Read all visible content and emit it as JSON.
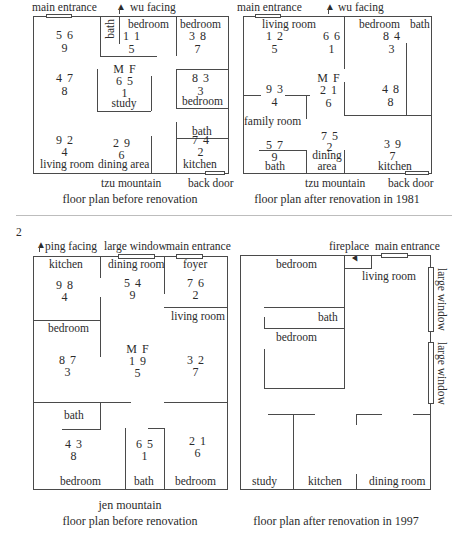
{
  "figure_number": "2",
  "plan1": {
    "top_labels": {
      "entrance": "main entrance",
      "facing": "wu facing"
    },
    "rooms": {
      "bath": "bath",
      "bedroom_a": "bedroom",
      "bedroom_b": "bedroom",
      "study": "study",
      "bedroom_c": "bedroom",
      "bath2": "bath",
      "living_room": "living room",
      "dining_area": "dining area",
      "kitchen": "kitchen"
    },
    "numbers": {
      "nw": [
        "5 6",
        "9"
      ],
      "bedroom_a": [
        "1 1",
        "5"
      ],
      "bedroom_b": [
        "3 8",
        "7"
      ],
      "w": [
        "4 7",
        "8"
      ],
      "center_head": "M F",
      "center": [
        "6 5",
        "1"
      ],
      "bedroom_c": [
        "8 3",
        "3"
      ],
      "sw": [
        "9 2",
        "4"
      ],
      "s": [
        "2 9",
        "6"
      ],
      "se": [
        "7 4",
        "2"
      ]
    },
    "bottom_labels": {
      "mountain": "tzu mountain",
      "back_door": "back door"
    },
    "caption": "floor plan before renovation"
  },
  "plan2": {
    "top_labels": {
      "entrance": "main entrance",
      "facing": "wu facing"
    },
    "rooms": {
      "living_room": "living room",
      "bedroom": "bedroom",
      "bath": "bath",
      "family_room": "family room",
      "bath2": "bath",
      "dining_area_1": "dining",
      "dining_area_2": "area",
      "kitchen": "kitchen"
    },
    "numbers": {
      "nw": [
        "1 2",
        "5"
      ],
      "n": [
        "6 6",
        "1"
      ],
      "ne": [
        "8 4",
        "3"
      ],
      "w": [
        "9 3",
        "4"
      ],
      "center_head": "M F",
      "center": [
        "2 1",
        "6"
      ],
      "e": [
        "4 8",
        "8"
      ],
      "sw": [
        "5 7",
        "9"
      ],
      "s": [
        "7 5",
        "2"
      ],
      "se": [
        "3 9",
        "7"
      ]
    },
    "bottom_labels": {
      "mountain": "tzu mountain",
      "back_door": "back door"
    },
    "caption": "floor plan after renovation in 1981"
  },
  "plan3": {
    "top_labels": {
      "facing": "ping facing",
      "window": "large window",
      "entrance": "main entrance"
    },
    "rooms": {
      "kitchen": "kitchen",
      "dining_room": "dining room",
      "foyer": "foyer",
      "living_room": "living room",
      "bedroom_a": "bedroom",
      "bath": "bath",
      "bedroom_b": "bedroom",
      "bath2": "bath",
      "bedroom_c": "bedroom"
    },
    "numbers": {
      "nw": [
        "9 8",
        "4"
      ],
      "n": [
        "5 4",
        "9"
      ],
      "ne": [
        "7 6",
        "2"
      ],
      "w": [
        "8 7",
        "3"
      ],
      "center_head": "M F",
      "center": [
        "1 9",
        "5"
      ],
      "e": [
        "3 2",
        "7"
      ],
      "sw": [
        "4 3",
        "8"
      ],
      "s": [
        "6 5",
        "1"
      ],
      "se": [
        "2 1",
        "6"
      ]
    },
    "bottom_labels": {
      "mountain": "jen mountain"
    },
    "caption": "floor plan before renovation"
  },
  "plan4": {
    "top_labels": {
      "fireplace": "fireplace",
      "entrance": "main entrance"
    },
    "side_labels": {
      "window_1": "large window",
      "window_2": "large window"
    },
    "rooms": {
      "bedroom_a": "bedroom",
      "living_room": "living room",
      "bath": "bath",
      "bedroom_b": "bedroom",
      "study": "study",
      "kitchen": "kitchen",
      "dining_room": "dining room"
    },
    "caption": "floor plan after renovation in 1997"
  }
}
